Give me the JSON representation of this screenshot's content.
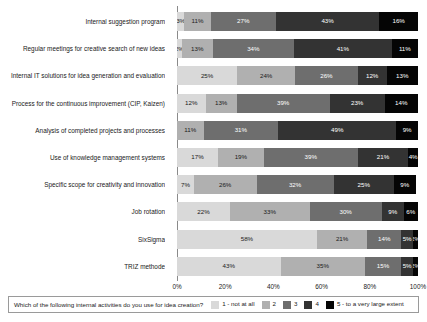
{
  "chart_data": {
    "type": "bar",
    "orientation": "horizontal",
    "stacked": true,
    "normalized": true,
    "title": "",
    "xlabel": "",
    "ylabel": "",
    "xlim": [
      0,
      100
    ],
    "grid": false,
    "legend_position": "bottom",
    "legend_title": "Which of the following internal activities do you use for idea creation?",
    "xticks": [
      "0%",
      "20%",
      "40%",
      "60%",
      "80%",
      "100%"
    ],
    "xtick_values": [
      0,
      20,
      40,
      60,
      80,
      100
    ],
    "categories": [
      "Internal suggestion program",
      "Regular meetings for creative search of new ideas",
      "Internal IT solutions for idea generation and evaluation",
      "Process for the continuous improvement (CIP, Kaizen)",
      "Analysis of completed projects and processes",
      "Use of knowledge management systems",
      "Specific scope for creativity and innovation",
      "Job rotation",
      "SixSigma",
      "TRIZ methode"
    ],
    "series": [
      {
        "name": "1 - not at all",
        "color": "#d9d9d9",
        "label_color": "#1a1a1a",
        "values": [
          3,
          2,
          25,
          12,
          0,
          17,
          7,
          22,
          58,
          43
        ],
        "labels": [
          "3%",
          "2%",
          "25%",
          "12%",
          "0%",
          "17%",
          "7%",
          "22%",
          "58%",
          "43%"
        ]
      },
      {
        "name": "2",
        "color": "#b0b0b0",
        "label_color": "#1a1a1a",
        "values": [
          11,
          13,
          24,
          13,
          11,
          19,
          26,
          33,
          21,
          35
        ],
        "labels": [
          "11%",
          "13%",
          "24%",
          "13%",
          "11%",
          "19%",
          "26%",
          "33%",
          "21%",
          "35%"
        ]
      },
      {
        "name": "3",
        "color": "#6e6e6e",
        "label_color": "#ffffff",
        "values": [
          27,
          34,
          26,
          39,
          31,
          39,
          32,
          30,
          14,
          15
        ],
        "labels": [
          "27%",
          "34%",
          "26%",
          "39%",
          "31%",
          "39%",
          "32%",
          "30%",
          "14%",
          "15%"
        ]
      },
      {
        "name": "4",
        "color": "#333333",
        "label_color": "#ffffff",
        "values": [
          43,
          41,
          12,
          23,
          49,
          21,
          25,
          9,
          5,
          5
        ],
        "labels": [
          "43%",
          "41%",
          "12%",
          "23%",
          "49%",
          "21%",
          "25%",
          "9%",
          "5%",
          "5%"
        ]
      },
      {
        "name": "5 - to a very large extent",
        "color": "#050505",
        "label_color": "#ffffff",
        "values": [
          16,
          11,
          13,
          14,
          9,
          4,
          9,
          6,
          2,
          2
        ],
        "labels": [
          "16%",
          "11%",
          "13%",
          "14%",
          "9%",
          "4%",
          "9%",
          "6%",
          "2%",
          "2%"
        ]
      }
    ]
  }
}
